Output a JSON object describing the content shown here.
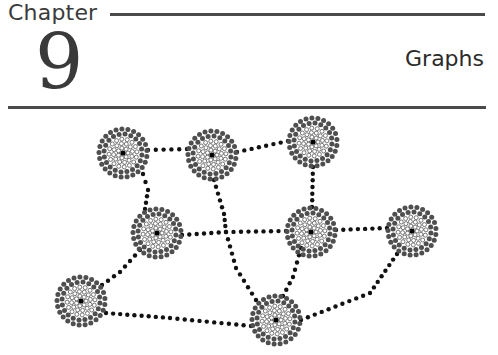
{
  "header": {
    "chapter_label": "Chapter",
    "chapter_number": "9",
    "chapter_title": "Graphs"
  },
  "figure": {
    "colors": {
      "center_dot": "#000000",
      "inner_ring_stroke": "#555555",
      "inner_ring_fill": "#ffffff",
      "outer_ring_fill": "#4f4f4f",
      "edge_dot": "#111111",
      "rule": "#4a4a4a",
      "text": "#3a3a3a"
    },
    "nodes": [
      {
        "id": "n1",
        "x": 123,
        "y": 153
      },
      {
        "id": "n2",
        "x": 212,
        "y": 155
      },
      {
        "id": "n3",
        "x": 313,
        "y": 142
      },
      {
        "id": "n4",
        "x": 157,
        "y": 233
      },
      {
        "id": "n5",
        "x": 311,
        "y": 232
      },
      {
        "id": "n6",
        "x": 412,
        "y": 231
      },
      {
        "id": "n7",
        "x": 81,
        "y": 301
      },
      {
        "id": "n8",
        "x": 276,
        "y": 320
      }
    ],
    "edges": [
      {
        "path": [
          [
            148,
            150
          ],
          [
            187,
            149
          ]
        ]
      },
      {
        "path": [
          [
            237,
            152
          ],
          [
            288,
            141
          ]
        ]
      },
      {
        "path": [
          [
            143,
            174
          ],
          [
            148,
            190
          ],
          [
            145,
            209
          ]
        ]
      },
      {
        "path": [
          [
            214,
            180
          ],
          [
            224,
            214
          ],
          [
            226,
            232
          ],
          [
            236,
            268
          ],
          [
            256,
            300
          ]
        ]
      },
      {
        "path": [
          [
            182,
            235
          ],
          [
            226,
            232
          ],
          [
            286,
            231
          ]
        ]
      },
      {
        "path": [
          [
            313,
            167
          ],
          [
            312,
            207
          ]
        ]
      },
      {
        "path": [
          [
            336,
            230
          ],
          [
            387,
            228
          ]
        ]
      },
      {
        "path": [
          [
            140,
            250
          ],
          [
            120,
            272
          ],
          [
            102,
            285
          ]
        ]
      },
      {
        "path": [
          [
            106,
            313
          ],
          [
            170,
            318
          ],
          [
            251,
            326
          ]
        ]
      },
      {
        "path": [
          [
            301,
            248
          ],
          [
            293,
            277
          ],
          [
            283,
            296
          ]
        ]
      },
      {
        "path": [
          [
            397,
            254
          ],
          [
            370,
            293
          ],
          [
            301,
            320
          ]
        ]
      }
    ]
  }
}
